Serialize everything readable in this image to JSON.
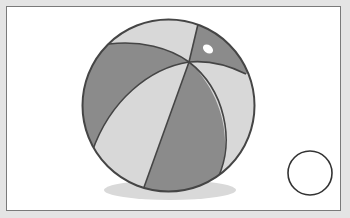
{
  "scene": {
    "description": "Illustration of a striped beach ball with a shadow and an empty answer circle",
    "colors": {
      "background": "#e4e4e4",
      "frame_fill": "#ffffff",
      "frame_border": "#7a7a7a",
      "stripe_dark": "#8b8b8b",
      "stripe_light": "#d8d8d8",
      "outline": "#454545",
      "shadow": "#d9d9d9",
      "highlight": "#ffffff"
    },
    "ball": {
      "cx": 168.5,
      "cy": 105.5,
      "r": 86
    },
    "answer_circle": {
      "cx": 310,
      "cy": 173,
      "r": 22,
      "label": ""
    }
  }
}
